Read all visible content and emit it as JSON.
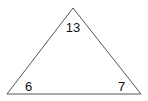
{
  "diagram": {
    "shape": "triangle",
    "stroke_color": "#555555",
    "labels": {
      "top": "13",
      "bottom_left": "6",
      "bottom_right": "7"
    }
  }
}
